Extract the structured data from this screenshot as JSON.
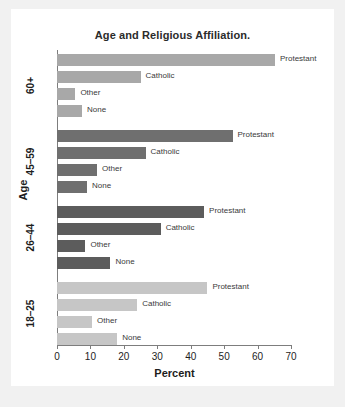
{
  "chart_data": {
    "type": "bar",
    "orientation": "horizontal",
    "title": "Age and Religious Affiliation.",
    "xlabel": "Percent",
    "ylabel": "Age",
    "xlim": [
      0,
      70
    ],
    "xticks": [
      0,
      10,
      20,
      30,
      40,
      50,
      60,
      70
    ],
    "xtick_labels": [
      "0",
      "10",
      "20",
      "30",
      "40",
      "50",
      "60",
      "70"
    ],
    "grid": false,
    "legend": "none (bars labeled inline)",
    "categories": [
      "60+",
      "45–59",
      "26–44",
      "18–25"
    ],
    "series": [
      {
        "name": "Protestant",
        "values": [
          65.2,
          52.5,
          44.0,
          45.0
        ]
      },
      {
        "name": "Catholic",
        "values": [
          25.0,
          26.5,
          31.0,
          24.0
        ]
      },
      {
        "name": "Other",
        "values": [
          5.5,
          12.0,
          8.5,
          10.5
        ]
      },
      {
        "name": "None",
        "values": [
          7.5,
          9.0,
          16.0,
          18.0
        ]
      }
    ],
    "groups": [
      {
        "category": "60+",
        "color": "#a8a8a8",
        "bars": [
          {
            "label": "Protestant",
            "value": 65.2
          },
          {
            "label": "Catholic",
            "value": 25.0
          },
          {
            "label": "Other",
            "value": 5.5
          },
          {
            "label": "None",
            "value": 7.5
          }
        ]
      },
      {
        "category": "45–59",
        "color": "#6f6f6f",
        "bars": [
          {
            "label": "Protestant",
            "value": 52.5
          },
          {
            "label": "Catholic",
            "value": 26.5
          },
          {
            "label": "Other",
            "value": 12.0
          },
          {
            "label": "None",
            "value": 9.0
          }
        ]
      },
      {
        "category": "26–44",
        "color": "#5c5c5c",
        "bars": [
          {
            "label": "Protestant",
            "value": 44.0
          },
          {
            "label": "Catholic",
            "value": 31.0
          },
          {
            "label": "Other",
            "value": 8.5
          },
          {
            "label": "None",
            "value": 16.0
          }
        ]
      },
      {
        "category": "18–25",
        "color": "#c6c6c6",
        "bars": [
          {
            "label": "Protestant",
            "value": 45.0
          },
          {
            "label": "Catholic",
            "value": 24.0
          },
          {
            "label": "Other",
            "value": 10.5
          },
          {
            "label": "None",
            "value": 18.0
          }
        ]
      }
    ]
  },
  "colors": {
    "axis": "#7d7d7d",
    "text": "#1d1d1d",
    "card_background": "#ffffff",
    "page_background": "#f1f1f1"
  }
}
